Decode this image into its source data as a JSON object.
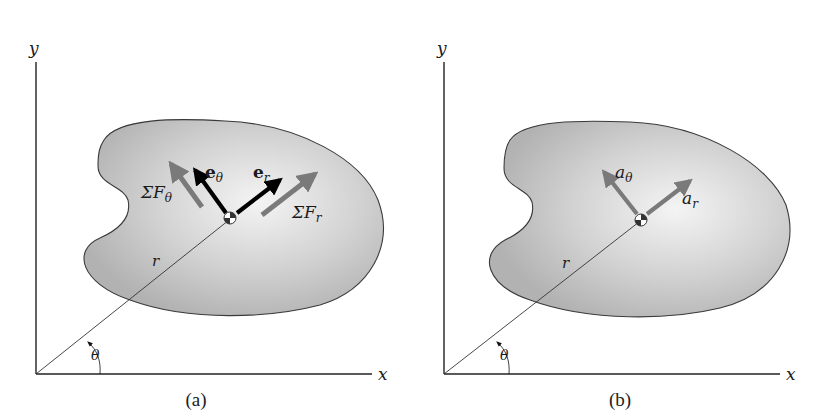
{
  "figure": {
    "panels": [
      {
        "id": "a",
        "caption": "(a)",
        "axes": {
          "x_label": "x",
          "y_label": "y"
        },
        "position_vector_label": "r",
        "angle_label": "θ",
        "vectors": [
          {
            "name": "e_theta",
            "base": "e",
            "sub": "θ",
            "style": "bold-black"
          },
          {
            "name": "e_r",
            "base": "e",
            "sub": "r",
            "style": "bold-black"
          },
          {
            "name": "sum_F_theta",
            "base": "ΣF",
            "sub": "θ",
            "style": "gray"
          },
          {
            "name": "sum_F_r",
            "base": "ΣF",
            "sub": "r",
            "style": "gray"
          }
        ]
      },
      {
        "id": "b",
        "caption": "(b)",
        "axes": {
          "x_label": "x",
          "y_label": "y"
        },
        "position_vector_label": "r",
        "angle_label": "θ",
        "vectors": [
          {
            "name": "a_theta",
            "base": "a",
            "sub": "θ",
            "style": "gray"
          },
          {
            "name": "a_r",
            "base": "a",
            "sub": "r",
            "style": "gray"
          }
        ]
      }
    ],
    "colors": {
      "blob_fill_center": "#f2f2f2",
      "blob_fill_edge": "#b4b4b4",
      "blob_outline": "#3a3a3a",
      "unit_vector": "#000000",
      "force_vector": "#7a7a7a",
      "axis": "#222222"
    }
  }
}
